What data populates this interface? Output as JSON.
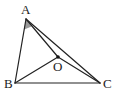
{
  "diagram": {
    "type": "geometry",
    "points": {
      "A": {
        "label": "A",
        "x": 26,
        "y": 19,
        "label_x": 21,
        "label_y": 14
      },
      "B": {
        "label": "B",
        "x": 15,
        "y": 83,
        "label_x": 4,
        "label_y": 88
      },
      "C": {
        "label": "C",
        "x": 100,
        "y": 83,
        "label_x": 103,
        "label_y": 88
      },
      "O": {
        "label": "O",
        "x": 58,
        "y": 57,
        "label_x": 53,
        "label_y": 71
      }
    },
    "segments": [
      [
        "A",
        "B"
      ],
      [
        "B",
        "C"
      ],
      [
        "A",
        "C"
      ],
      [
        "A",
        "O"
      ],
      [
        "O",
        "C"
      ],
      [
        "B",
        "O"
      ]
    ],
    "angle_marks": [
      {
        "vertex": "A",
        "between": [
          "B",
          "O"
        ],
        "fill": "#9a9a9a"
      }
    ],
    "colors": {
      "line": "#222222",
      "background": "#ffffff",
      "point_O": "#111111"
    }
  }
}
